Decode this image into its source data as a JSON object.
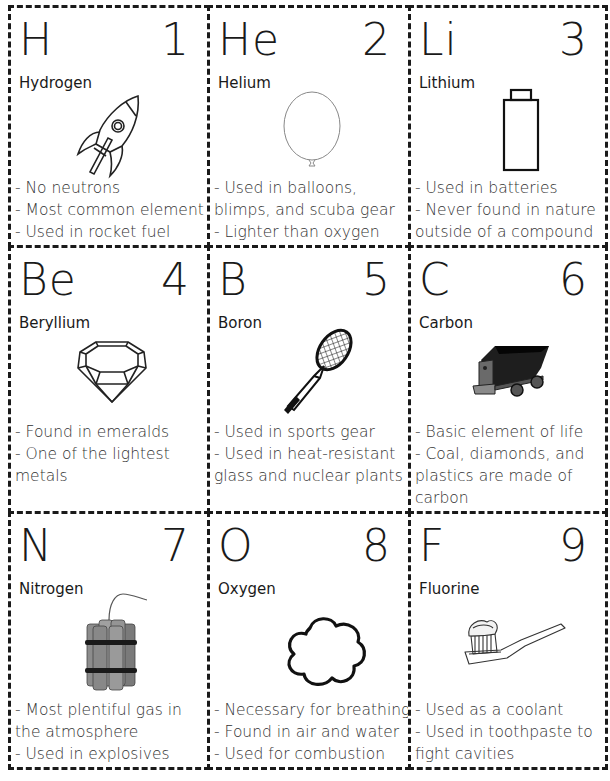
{
  "cards": [
    {
      "symbol": "H",
      "number": "1",
      "name": "Hydrogen",
      "icon": "rocket-icon",
      "facts": [
        "- No neutrons",
        "- Most common element",
        "- Used in rocket fuel"
      ]
    },
    {
      "symbol": "He",
      "number": "2",
      "name": "Helium",
      "icon": "balloon-icon",
      "facts": [
        "- Used in balloons,",
        "blimps, and scuba gear",
        "- Lighter than oxygen"
      ]
    },
    {
      "symbol": "Li",
      "number": "3",
      "name": "Lithium",
      "icon": "battery-icon",
      "facts": [
        "- Used in batteries",
        "- Never found in nature",
        "outside of a compound"
      ]
    },
    {
      "symbol": "Be",
      "number": "4",
      "name": "Beryllium",
      "icon": "gem-icon",
      "facts": [
        "- Found in emeralds",
        "- One of the lightest",
        "metals"
      ]
    },
    {
      "symbol": "B",
      "number": "5",
      "name": "Boron",
      "icon": "tennis-racket-icon",
      "facts": [
        "- Used in sports gear",
        "- Used in heat-resistant",
        "glass and nuclear plants"
      ]
    },
    {
      "symbol": "C",
      "number": "6",
      "name": "Carbon",
      "icon": "coal-cart-icon",
      "facts": [
        "- Basic element of life",
        "- Coal, diamonds, and",
        "plastics are made of",
        "carbon"
      ]
    },
    {
      "symbol": "N",
      "number": "7",
      "name": "Nitrogen",
      "icon": "dynamite-icon",
      "facts": [
        "- Most plentiful gas in",
        "the atmosphere",
        "- Used in explosives"
      ]
    },
    {
      "symbol": "O",
      "number": "8",
      "name": "Oxygen",
      "icon": "cloud-icon",
      "facts": [
        "- Necessary for breathing",
        "- Found in air and water",
        "- Used for combustion"
      ]
    },
    {
      "symbol": "F",
      "number": "9",
      "name": "Fluorine",
      "icon": "toothbrush-icon",
      "facts": [
        "- Used as a coolant",
        "- Used in toothpaste to",
        "fight cavities"
      ]
    }
  ]
}
